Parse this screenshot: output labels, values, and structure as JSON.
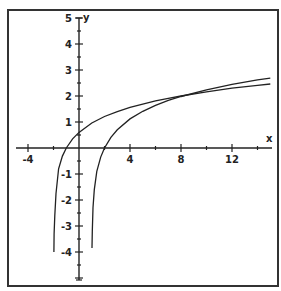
{
  "chart_data": {
    "type": "line",
    "title": "",
    "xlabel": "x",
    "ylabel": "y",
    "xlim": [
      -5,
      15.5
    ],
    "ylim": [
      -5.2,
      5
    ],
    "grid": false,
    "legend": null,
    "x_ticks_labeled": [
      -4,
      4,
      8,
      12
    ],
    "x_tick_labels": [
      "-4",
      "4",
      "8",
      "12"
    ],
    "x_ticks_minor_step": 2,
    "y_ticks_labeled": [
      5,
      4,
      3,
      2,
      1,
      -1,
      -2,
      -3,
      -4
    ],
    "y_tick_labels": [
      "5",
      "4",
      "3",
      "2",
      "1",
      "-1",
      "-2",
      "-3",
      "-4"
    ],
    "series": [
      {
        "name": "curve-left-asymptote-x=-2",
        "x": [
          -1.97,
          -1.95,
          -1.9,
          -1.8,
          -1.6,
          -1.3,
          -1.0,
          -0.5,
          0,
          1,
          2,
          3,
          4,
          6,
          7,
          8,
          10,
          12,
          14,
          15
        ],
        "y": [
          -4.0,
          -3.3,
          -2.6,
          -1.75,
          -0.8,
          -0.31,
          0.0,
          0.35,
          0.6,
          0.96,
          1.21,
          1.4,
          1.56,
          1.81,
          1.91,
          2.0,
          2.16,
          2.3,
          2.41,
          2.46
        ]
      },
      {
        "name": "curve-right-asymptote-x=1",
        "x": [
          1.02,
          1.04,
          1.1,
          1.2,
          1.4,
          1.7,
          2.0,
          2.5,
          3,
          4,
          5,
          6,
          7,
          8,
          10,
          12,
          14,
          15
        ],
        "y": [
          -3.85,
          -3.2,
          -2.3,
          -1.6,
          -0.9,
          -0.35,
          0.0,
          0.41,
          0.7,
          1.12,
          1.41,
          1.64,
          1.83,
          1.98,
          2.24,
          2.45,
          2.62,
          2.69
        ]
      }
    ],
    "annotations": []
  },
  "plot": {
    "x_axis_label": "x",
    "y_axis_label": "y"
  }
}
